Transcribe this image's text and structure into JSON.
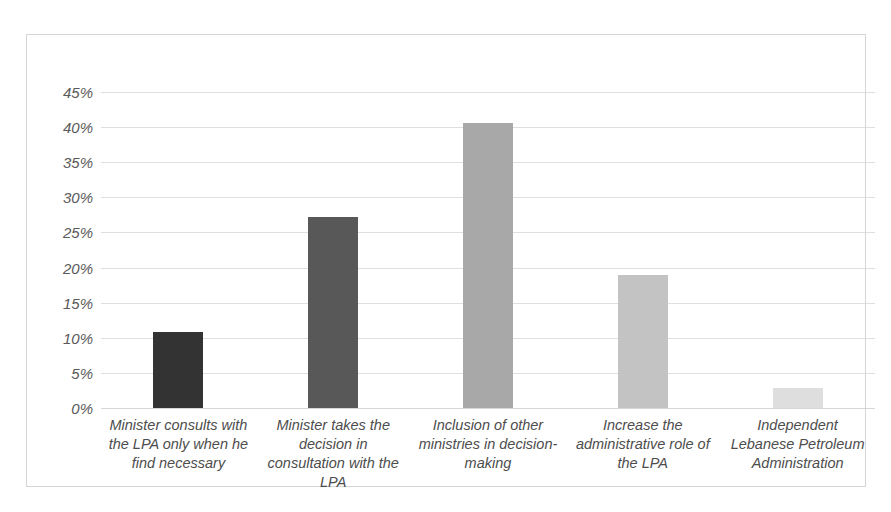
{
  "chart_data": {
    "type": "bar",
    "title": "",
    "subtitle": "",
    "xlabel": "",
    "ylabel": "",
    "ylim": [
      0,
      45
    ],
    "grid": true,
    "legend": "none",
    "tick_format": "percent",
    "categories": [
      "Minister consults with the LPA only when he find necessary",
      "Minister takes the decision in consultation with the LPA",
      "Inclusion of other ministries in decision-making",
      "Increase the administrative role of the LPA",
      "Independent Lebanese Petroleum Administration"
    ],
    "values": [
      10.8,
      27.2,
      40.6,
      18.9,
      2.8
    ],
    "bar_colors": [
      "#333333",
      "#585858",
      "#a8a8a8",
      "#c3c3c3",
      "#dedede"
    ],
    "ytick_labels": [
      "45%",
      "40%",
      "35%",
      "30%",
      "25%",
      "20%",
      "15%",
      "10%",
      "5%",
      "0%"
    ],
    "ytick_values": [
      45,
      40,
      35,
      30,
      25,
      20,
      15,
      10,
      5,
      0
    ]
  },
  "style": {
    "background": "#ffffff",
    "border_color": "#d6d6d6",
    "gridline_color": "#d9d9d9",
    "tick_text_color": "#5a5a5a",
    "category_text_color": "#4d4d4d"
  }
}
